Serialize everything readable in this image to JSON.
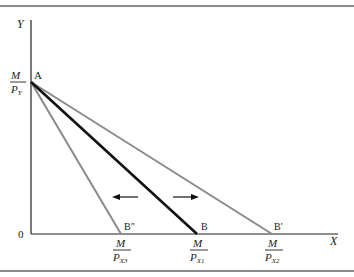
{
  "diagram": {
    "type": "budget-line-shift",
    "axes": {
      "y_label": "Y",
      "x_label": "X",
      "origin_label": "0"
    },
    "y_intercept": {
      "point_label": "A",
      "numerator": "M",
      "denominator": "P",
      "denominator_sub": "Y"
    },
    "x_intercepts": [
      {
        "point_label": "B\"",
        "numerator": "M",
        "denominator": "P",
        "denominator_sub": "X3",
        "color": "#8a8a8a"
      },
      {
        "point_label": "B",
        "numerator": "M",
        "denominator": "P",
        "denominator_sub": "X1",
        "color": "#111111"
      },
      {
        "point_label": "B'",
        "numerator": "M",
        "denominator": "P",
        "denominator_sub": "X2",
        "color": "#8a8a8a"
      }
    ],
    "arrows": [
      {
        "direction": "left"
      },
      {
        "direction": "right"
      }
    ],
    "colors": {
      "axis": "#222222",
      "original_line": "#111111",
      "shifted_lines": "#8a8a8a",
      "frame_rule": "#555555"
    }
  }
}
